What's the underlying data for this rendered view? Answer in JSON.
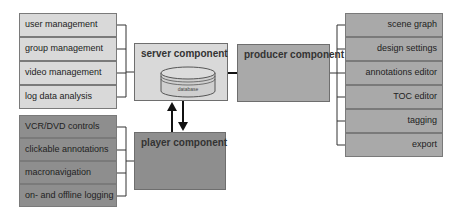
{
  "server_features": {
    "items": [
      "user management",
      "group management",
      "video management",
      "log data analysis"
    ]
  },
  "player_features": {
    "items": [
      "VCR/DVD controls",
      "clickable annotations",
      "macronavigation",
      "on- and offline logging"
    ]
  },
  "producer_features": {
    "items": [
      "scene graph",
      "design settings",
      "annotations editor",
      "TOC editor",
      "tagging",
      "export"
    ]
  },
  "components": {
    "server": {
      "title": "server component",
      "database_label": "database"
    },
    "player": {
      "title": "player component"
    },
    "producer": {
      "title": "producer component"
    }
  },
  "colors": {
    "light": "#d9d9d9",
    "medium": "#a9a9a9",
    "dark": "#8e8e8e"
  }
}
